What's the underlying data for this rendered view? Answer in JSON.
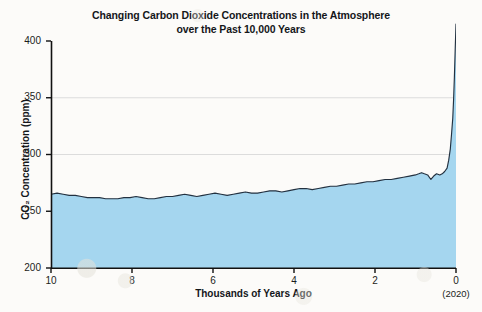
{
  "chart_data": {
    "type": "area",
    "title": "Changing Carbon Dioxide Concentrations in the Atmosphere\nover the Past 10,000 Years",
    "xlabel": "Thousands of Years Ago",
    "ylabel": "CO₂ Concentration (ppm)",
    "x_note": "(2020)",
    "xlim": [
      10,
      0
    ],
    "ylim": [
      200,
      400
    ],
    "x_reversed": true,
    "grid": true,
    "grid_levels": [
      250,
      300,
      350
    ],
    "legend": null,
    "xticks": [
      10,
      8,
      6,
      4,
      2,
      0
    ],
    "xtick_labels": [
      "10",
      "8",
      "6",
      "4",
      "2",
      "0"
    ],
    "yticks": [
      200,
      250,
      300,
      350,
      400
    ],
    "ytick_labels": [
      "200",
      "250",
      "300",
      "350",
      "400"
    ],
    "colors": {
      "fill": "#a5d6ef",
      "line": "#233140",
      "axis": "#111111",
      "grid": "#dcdcdc",
      "background": "#fcfbf9"
    },
    "series": [
      {
        "name": "Atmospheric CO2",
        "units": "ppm",
        "x": [
          10.0,
          9.85,
          9.7,
          9.55,
          9.4,
          9.25,
          9.1,
          8.95,
          8.8,
          8.65,
          8.5,
          8.35,
          8.2,
          8.05,
          7.9,
          7.75,
          7.6,
          7.45,
          7.3,
          7.15,
          7.0,
          6.85,
          6.7,
          6.55,
          6.4,
          6.25,
          6.1,
          5.95,
          5.8,
          5.65,
          5.5,
          5.35,
          5.2,
          5.05,
          4.9,
          4.75,
          4.6,
          4.45,
          4.3,
          4.15,
          4.0,
          3.85,
          3.7,
          3.55,
          3.4,
          3.25,
          3.1,
          2.95,
          2.8,
          2.65,
          2.5,
          2.35,
          2.2,
          2.05,
          1.9,
          1.75,
          1.6,
          1.45,
          1.3,
          1.15,
          1.0,
          0.92,
          0.85,
          0.78,
          0.7,
          0.62,
          0.55,
          0.48,
          0.4,
          0.34,
          0.28,
          0.22,
          0.18,
          0.14,
          0.11,
          0.08,
          0.06,
          0.04,
          0.02,
          0.0
        ],
        "y": [
          265,
          266,
          265,
          264,
          264,
          263,
          262,
          262,
          262,
          261,
          261,
          261,
          262,
          262,
          263,
          262,
          261,
          261,
          262,
          263,
          263,
          264,
          265,
          264,
          263,
          264,
          265,
          266,
          265,
          264,
          265,
          266,
          267,
          266,
          266,
          267,
          268,
          268,
          267,
          268,
          269,
          270,
          270,
          269,
          270,
          271,
          272,
          272,
          273,
          274,
          274,
          275,
          276,
          276,
          277,
          278,
          278,
          279,
          280,
          281,
          282,
          283,
          284,
          283,
          282,
          278,
          281,
          283,
          282,
          283,
          285,
          288,
          295,
          305,
          318,
          332,
          348,
          368,
          392,
          415
        ]
      }
    ],
    "annotations": [
      {
        "label": "present-day spike",
        "x": 0.0,
        "y": 415
      }
    ]
  }
}
